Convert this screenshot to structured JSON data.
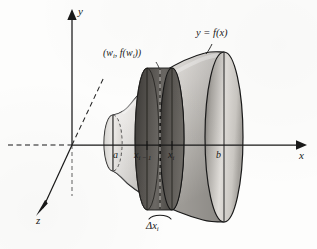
{
  "figure": {
    "kind": "solid-of-revolution-disk-method",
    "background_color": "#fdfdfc",
    "ink_color": "#191919"
  },
  "axes": {
    "y_label": "y",
    "x_label": "x",
    "z_label": "z",
    "x_axis_dashed_left_of_origin": true,
    "z_axis_dashed_above_origin": true
  },
  "labels": {
    "curve": "y = f(x)",
    "point_prefix": "(w",
    "point_sub_1": "i",
    "point_mid": ", f(w",
    "point_sub_2": "i",
    "point_suffix": "))",
    "point_full": "(wi, f(wi))",
    "left_bound": "a",
    "right_bound": "b",
    "tick_left_base": "x",
    "tick_left_sub": "i − 1",
    "tick_right_base": "x",
    "tick_right_sub": "i",
    "delta_base": "Δx",
    "delta_sub": "i"
  },
  "colors": {
    "ink": "#191919",
    "surface_light": "#f1efec",
    "surface_mid": "#c9c6c1",
    "surface_dark": "#8e8b86",
    "disk_dark": "#4a4844",
    "disk_darker": "#35332f",
    "cap_light": "#e6e3df"
  },
  "geometry": {
    "origin": {
      "x": 72,
      "y": 145
    },
    "y_axis_top": 12,
    "x_axis_right": 302,
    "z_axis_end": {
      "x": 36,
      "y": 214
    },
    "left_cap": {
      "cx": 113,
      "cy": 143,
      "rx": 9,
      "ry": 28
    },
    "right_cap": {
      "cx": 224,
      "cy": 137,
      "rx": 19,
      "ry": 85
    },
    "disk": {
      "front_cx": 172,
      "back_cx": 147,
      "cy": 139,
      "rx": 12,
      "ry": 71
    }
  }
}
